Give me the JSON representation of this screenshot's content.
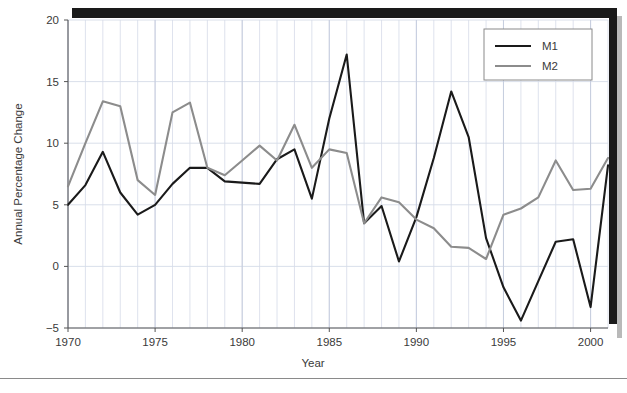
{
  "chart_data": {
    "type": "line",
    "title": "",
    "xlabel": "Year",
    "ylabel": "Annual Percentage Change",
    "xlim": [
      1970,
      2001
    ],
    "ylim": [
      -5,
      20
    ],
    "xticks": [
      1970,
      1975,
      1980,
      1985,
      1990,
      1995,
      2000
    ],
    "yticks": [
      -5,
      0,
      5,
      10,
      15,
      20
    ],
    "grid": true,
    "grid_minor_x": true,
    "legend_position": "top-right",
    "x": [
      1970,
      1971,
      1972,
      1973,
      1974,
      1975,
      1976,
      1977,
      1978,
      1979,
      1980,
      1981,
      1982,
      1983,
      1984,
      1985,
      1986,
      1987,
      1988,
      1989,
      1990,
      1991,
      1992,
      1993,
      1994,
      1995,
      1996,
      1997,
      1998,
      1999,
      2000,
      2001
    ],
    "series": [
      {
        "name": "M1",
        "color": "#1a1a1a",
        "width": 2.1,
        "values": [
          5.0,
          6.6,
          9.3,
          6.0,
          4.2,
          5.0,
          6.7,
          8.0,
          8.0,
          6.9,
          6.8,
          6.7,
          8.7,
          9.5,
          5.5,
          12.0,
          17.2,
          3.5,
          4.9,
          0.4,
          4.0,
          8.8,
          14.2,
          10.5,
          2.3,
          -1.7,
          -4.4,
          -1.2,
          2.0,
          2.2,
          -3.3,
          8.2
        ]
      },
      {
        "name": "M2",
        "color": "#8c8c8c",
        "width": 2.1,
        "values": [
          6.5,
          10.0,
          13.4,
          13.0,
          7.0,
          5.8,
          12.5,
          13.3,
          8.0,
          7.4,
          8.6,
          9.8,
          8.6,
          11.5,
          8.0,
          9.5,
          9.2,
          3.5,
          5.6,
          5.2,
          3.8,
          3.1,
          1.6,
          1.5,
          0.6,
          4.2,
          4.7,
          5.6,
          8.6,
          6.2,
          6.3,
          8.8
        ]
      }
    ]
  },
  "legend": {
    "entries": [
      {
        "label": "M1"
      },
      {
        "label": "M2"
      }
    ]
  },
  "axes": {
    "x_title": "Year",
    "y_title": "Annual Percentage Change",
    "x_tick_labels": [
      "1970",
      "1975",
      "1980",
      "1985",
      "1990",
      "1995",
      "2000"
    ],
    "y_tick_labels": [
      "−5",
      "0",
      "5",
      "10",
      "15",
      "20"
    ]
  },
  "colors": {
    "m1": "#1a1a1a",
    "m2": "#8c8c8c",
    "grid": "#d5dbe8",
    "axis": "#555555",
    "background": "#ffffff"
  }
}
